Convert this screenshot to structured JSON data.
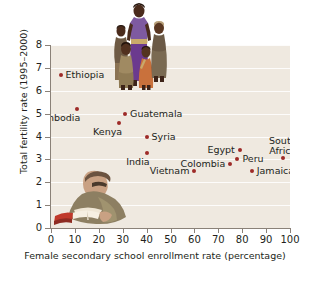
{
  "chart_data": {
    "type": "scatter",
    "title": "",
    "xlabel": "Female secondary school enrollment rate (percentage)",
    "ylabel": "Total fertility rate (1995–2000)",
    "xlim": [
      0,
      100
    ],
    "ylim": [
      0,
      8
    ],
    "xticks": [
      "0",
      "10",
      "20",
      "30",
      "40",
      "50",
      "60",
      "70",
      "80",
      "90",
      "100"
    ],
    "yticks": [
      "0",
      "1",
      "2",
      "3",
      "4",
      "5",
      "6",
      "7",
      "8"
    ],
    "grid": "horizontal",
    "legend": "none",
    "marker_color": "#9e2b28",
    "plot_background": "#efe9e0",
    "points": [
      {
        "label": "Ethiopia",
        "x": 4,
        "y": 6.7,
        "label_pos": "right"
      },
      {
        "label": "Cambodia",
        "x": 11,
        "y": 5.2,
        "label_pos": "below-left"
      },
      {
        "label": "Guatemala",
        "x": 31,
        "y": 5.0,
        "label_pos": "right"
      },
      {
        "label": "Kenya",
        "x": 28.5,
        "y": 4.6,
        "label_pos": "below-left"
      },
      {
        "label": "Syria",
        "x": 40,
        "y": 4.0,
        "label_pos": "right"
      },
      {
        "label": "India",
        "x": 40,
        "y": 3.3,
        "label_pos": "below-left"
      },
      {
        "label": "Egypt",
        "x": 79,
        "y": 3.4,
        "label_pos": "left"
      },
      {
        "label": "South Africa",
        "x": 97,
        "y": 3.05,
        "label_pos": "above"
      },
      {
        "label": "Peru",
        "x": 78,
        "y": 3.0,
        "label_pos": "right"
      },
      {
        "label": "Colombia",
        "x": 75,
        "y": 2.8,
        "label_pos": "left"
      },
      {
        "label": "Vietnam",
        "x": 60,
        "y": 2.5,
        "label_pos": "left"
      },
      {
        "label": "Jamaica",
        "x": 84,
        "y": 2.5,
        "label_pos": "right"
      }
    ]
  },
  "photos": [
    {
      "name": "family-photo",
      "caption": "woman standing with four children"
    },
    {
      "name": "girl-reading-photo",
      "caption": "girl reading an open book"
    }
  ]
}
